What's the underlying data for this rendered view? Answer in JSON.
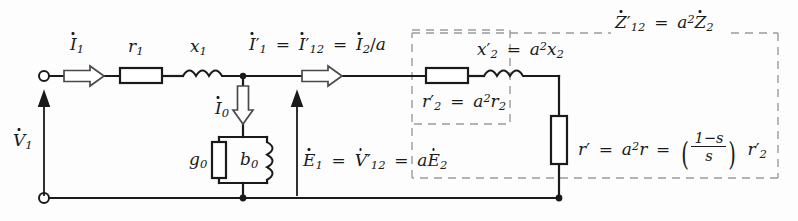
{
  "diagram": {
    "type": "circuit-schematic",
    "canvas": {
      "width": 798,
      "height": 221
    },
    "colors": {
      "wire": "#1a1a1a",
      "dashed_box": "#8a8a8a",
      "background": "#fdfdfd",
      "arrow_outline": "#555555"
    }
  },
  "labels": {
    "input_current": {
      "symbol": "I",
      "dot": true,
      "sub": "1",
      "text": "İ1"
    },
    "input_voltage": {
      "symbol": "V",
      "dot": true,
      "sub": "1",
      "text": "V̇1"
    },
    "stator_resistance": "r1",
    "stator_reactance": "x1",
    "magnetizing_current": {
      "text": "İ0"
    },
    "core_conductance": "g0",
    "magnetizing_susceptance": "b0",
    "emf_relation": "Ė1 = V̇′12 = aĖ2",
    "referred_current": "İ′1 = İ′12 = İ2/a",
    "referred_impedance_box": "Ż′12 = a²Ż2",
    "rotor_resistance_referred": "r′2 = a²r2",
    "rotor_reactance_referred": "x′2 = a²x2",
    "mechanical_resistance": "r′ = a²r = ((1−s)/s) r′2"
  },
  "formula_parts": {
    "emf": {
      "e1": "E",
      "e1_sub": "1",
      "eq1": "=",
      "v12": "V",
      "v12_prime": "′",
      "v12_sub": "12",
      "eq2": "=",
      "a": "a",
      "e2": "E",
      "e2_sub": "2"
    },
    "current": {
      "i1": "I",
      "i1_prime": "′",
      "i1_sub": "1",
      "eq1": "=",
      "i12": "I",
      "i12_prime": "′",
      "i12_sub": "12",
      "eq2": "=",
      "i2": "I",
      "i2_sub": "2",
      "slash": "/a"
    },
    "impedance": {
      "z": "Z",
      "z_prime": "′",
      "z_sub": "12",
      "eq": "=",
      "a": "a",
      "exp": "2",
      "z2": "Z",
      "z2_sub": "2"
    },
    "r2p": {
      "r": "r",
      "prime": "′",
      "sub": "2",
      "eq": "=",
      "a": "a",
      "exp": "2",
      "r2": "r",
      "r2sub": "2"
    },
    "x2p": {
      "x": "x",
      "prime": "′",
      "sub": "2",
      "eq": "=",
      "a": "a",
      "exp": "2",
      "x2": "x",
      "x2sub": "2"
    },
    "rmech": {
      "r": "r",
      "prime": "′",
      "eq1": "=",
      "a": "a",
      "exp": "2",
      "r_mid": "r",
      "eq2": "=",
      "num": "1−s",
      "den": "s",
      "rtail": "r",
      "rtail_prime": "′",
      "rtail_sub": "2"
    }
  },
  "components": [
    {
      "name": "r1-resistor",
      "kind": "resistor",
      "orientation": "horizontal",
      "x": 120,
      "y": 68,
      "w": 42,
      "h": 15,
      "label": "r1"
    },
    {
      "name": "x1-inductor",
      "kind": "inductor",
      "orientation": "horizontal",
      "x": 183,
      "y": 70,
      "w": 40,
      "h": 10,
      "label": "x1"
    },
    {
      "name": "g0-conductance",
      "kind": "resistor",
      "orientation": "vertical",
      "x": 212,
      "y": 142,
      "w": 14,
      "h": 36,
      "label": "g0"
    },
    {
      "name": "b0-susceptance",
      "kind": "inductor",
      "orientation": "vertical",
      "x": 262,
      "y": 142,
      "w": 11,
      "h": 38,
      "label": "b0"
    },
    {
      "name": "r2prime-resistor",
      "kind": "resistor",
      "orientation": "horizontal",
      "x": 426,
      "y": 68,
      "w": 42,
      "h": 15,
      "label": "r′2"
    },
    {
      "name": "x2prime-inductor",
      "kind": "inductor",
      "orientation": "horizontal",
      "x": 484,
      "y": 70,
      "w": 40,
      "h": 10,
      "label": "x′2"
    },
    {
      "name": "rprime-resistor",
      "kind": "resistor",
      "orientation": "vertical",
      "x": 551,
      "y": 116,
      "w": 16,
      "h": 48,
      "label": "r′"
    }
  ],
  "terminals": [
    {
      "name": "input-terminal-top",
      "x": 44,
      "y": 76
    },
    {
      "name": "input-terminal-bottom",
      "x": 44,
      "y": 198
    }
  ],
  "nodes": [
    {
      "name": "node-magnetizing-top",
      "x": 243,
      "y": 76
    },
    {
      "name": "node-magnetizing-bottom",
      "x": 243,
      "y": 198
    },
    {
      "name": "node-rotor-bottom",
      "x": 559,
      "y": 198
    }
  ],
  "dashed_boxes": [
    {
      "name": "referred-impedance-box",
      "x": 412,
      "y": 30,
      "w": 98,
      "h": 94
    },
    {
      "name": "rotor-branch-box",
      "x": 412,
      "y": 33,
      "w": 366,
      "h": 145
    }
  ],
  "arrows": [
    {
      "name": "i1-current-arrow",
      "kind": "hollow-right",
      "x": 68,
      "y": 76
    },
    {
      "name": "i1p-current-arrow",
      "kind": "hollow-right",
      "x": 300,
      "y": 76
    },
    {
      "name": "i0-current-arrow",
      "kind": "hollow-down",
      "x": 243,
      "y": 86
    },
    {
      "name": "v1-voltage-arrow",
      "kind": "solid-up",
      "x": 44,
      "y": 198
    },
    {
      "name": "e1-voltage-arrow",
      "kind": "solid-up",
      "x": 297,
      "y": 198
    }
  ]
}
